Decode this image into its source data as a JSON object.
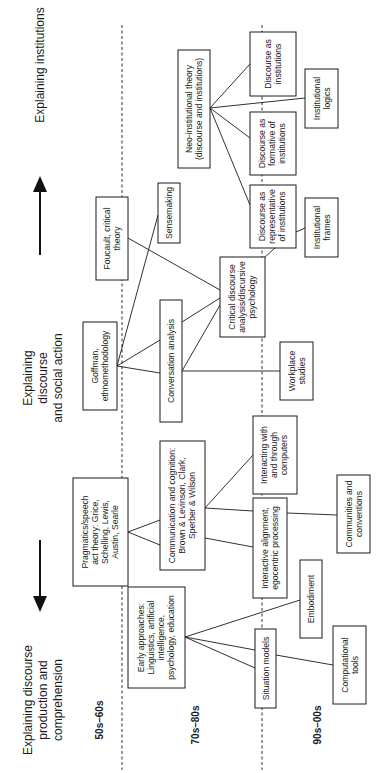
{
  "headers": {
    "production": [
      "Explaining discourse",
      "production and",
      "comprehension"
    ],
    "social_action": [
      "Explaining",
      "discourse",
      "and social action"
    ],
    "institutions": [
      "Explaining institutions"
    ]
  },
  "eras": {
    "e1": "50s–60s",
    "e2": "70s–80s",
    "e3": "90s–00s"
  },
  "nodes": {
    "pragmatics": [
      "Pragmatics/speech",
      "act theory: Grice,",
      "Schelling, Lewis,",
      "Austin, Searle"
    ],
    "goffman": [
      "Goffman,",
      "ethnomethodology"
    ],
    "foucault": [
      "Foucault, critical",
      "theory"
    ],
    "neo_institutional": [
      "Neo-institutional theory",
      "(discourse and institutions)"
    ],
    "early": [
      "Early approaches:",
      "Linguistics, artificial",
      "intelligence,",
      "psychology, education"
    ],
    "communication": [
      "Communication and cognition:",
      "Brown & Levinson, Clark,",
      "Sperber & Wilson"
    ],
    "conversation": [
      "Conversation analysis"
    ],
    "sensemaking": [
      "Sensemaking"
    ],
    "critical": [
      "Critical discourse",
      "analysis/discursive",
      "psychology"
    ],
    "disc_institutions": [
      "Discourse as",
      "institutions"
    ],
    "disc_formative": [
      "Discourse as",
      "formative of",
      "institutions"
    ],
    "disc_representative": [
      "Discourse as",
      "representative",
      "of institutions"
    ],
    "inst_logics": [
      "Institutional",
      "logics"
    ],
    "inst_frames": [
      "Institutional",
      "frames"
    ],
    "workplace": [
      "Workplace",
      "studies"
    ],
    "interacting": [
      "Interacting with",
      "and through",
      "computers"
    ],
    "alignment": [
      "Interactive alignment,",
      "egocentric processing"
    ],
    "communities": [
      "Communities and",
      "conventions"
    ],
    "situation": [
      "Situation models"
    ],
    "embodiment": [
      "Embodiment"
    ],
    "computational": [
      "Computational",
      "tools"
    ]
  },
  "arrows": {
    "left": "arrow-toward-production",
    "right": "arrow-toward-institutions"
  }
}
